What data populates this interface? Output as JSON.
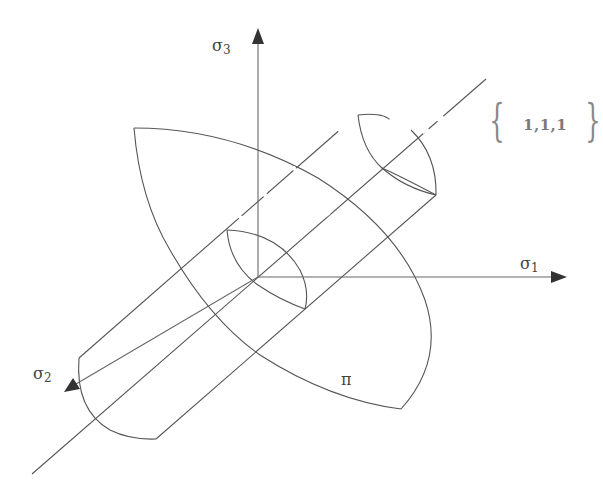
{
  "diagram": {
    "axes": {
      "sigma1": {
        "symbol": "σ",
        "subscript": "1"
      },
      "sigma2": {
        "symbol": "σ",
        "subscript": "2"
      },
      "sigma3": {
        "symbol": "σ",
        "subscript": "3"
      }
    },
    "hydrostatic_axis": {
      "label": "1,1,1"
    },
    "pi_plane": {
      "label": "π"
    },
    "colors": {
      "line": "#555555",
      "arrow": "#333333",
      "text": "#444444",
      "background": "#ffffff"
    }
  }
}
